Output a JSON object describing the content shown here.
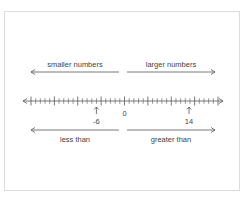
{
  "diagram": {
    "type": "number-line",
    "top_labels": {
      "left": "smaller numbers",
      "right": "larger numbers"
    },
    "bottom_labels": {
      "left": "less than",
      "right": "greater than"
    },
    "number_line": {
      "min": -20,
      "max": 20,
      "minor_step": 1,
      "major_step": 5,
      "zero_label": "0",
      "marked_points": [
        {
          "value": -6,
          "label": "-6"
        },
        {
          "value": 14,
          "label": "14"
        }
      ]
    },
    "colors": {
      "line": "#555555",
      "text": "#444444",
      "border": "#dcdcdc"
    }
  }
}
